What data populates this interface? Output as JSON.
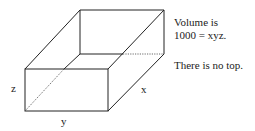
{
  "diagram": {
    "labels": {
      "z": "z",
      "y": "y",
      "x": "x"
    },
    "notes": [
      "Volume is",
      "1000 = xyz.",
      "There is no top."
    ],
    "stroke_color": "#222222"
  }
}
